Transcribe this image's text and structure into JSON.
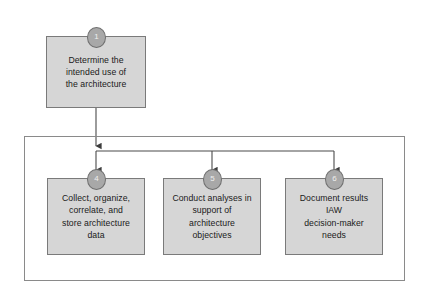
{
  "diagram": {
    "type": "flowchart",
    "title": "",
    "colors": {
      "node_fill": "#d6d6d6",
      "node_border": "#7a7a7a",
      "badge_fill": "#a8a8a8",
      "badge_border": "#6f6f6f",
      "badge_text": "#efefef",
      "connector": "#4a4a4a",
      "container_border": "#8a8a8a",
      "background": "#ffffff",
      "text": "#1a1a1a"
    },
    "container": {
      "name": "process-group-container",
      "label": ""
    },
    "nodes": [
      {
        "id": "node-1",
        "badge": "1",
        "label": "Determine the\nintended use of\nthe architecture"
      },
      {
        "id": "node-4",
        "badge": "4",
        "label": "Collect, organize,\ncorrelate, and\nstore architecture\ndata"
      },
      {
        "id": "node-5",
        "badge": "5",
        "label": "Conduct analyses in\nsupport of\narchitecture\nobjectives"
      },
      {
        "id": "node-6",
        "badge": "6",
        "label": "Document results\nIAW\ndecision-maker\nneeds"
      }
    ],
    "connectors": [
      {
        "from": "node-1",
        "to": "node-4"
      },
      {
        "from": "node-1",
        "to": "node-5"
      },
      {
        "from": "node-1",
        "to": "node-6"
      }
    ]
  }
}
